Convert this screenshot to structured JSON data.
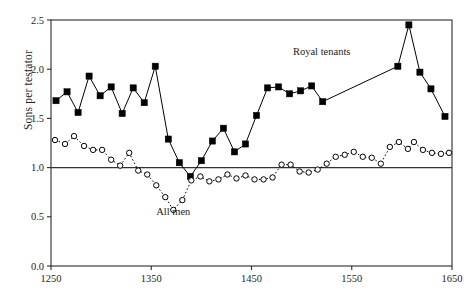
{
  "chart_data": {
    "type": "line",
    "title": "",
    "xlabel": "",
    "ylabel": "Sons per testator",
    "xlim": [
      1250,
      1650
    ],
    "ylim": [
      0.0,
      2.5
    ],
    "xticks": [
      1250,
      1350,
      1450,
      1550,
      1650
    ],
    "xtick_labels": [
      "1250",
      "1350",
      "1450",
      "1550",
      "1650"
    ],
    "yticks": [
      0.0,
      0.5,
      1.0,
      1.5,
      2.0,
      2.5
    ],
    "ytick_labels": [
      "0.0",
      "0.5",
      "1.0",
      "1.5",
      "2.0",
      "2.5"
    ],
    "grid": false,
    "legend_position": "inline-annotation",
    "reference_line": {
      "y": 1.0,
      "style": "solid",
      "color": "#333333"
    },
    "annotations": [
      {
        "text": "Royal tenants",
        "x": 1520,
        "y": 2.14
      },
      {
        "text": "All men",
        "x": 1372,
        "y": 0.52
      }
    ],
    "series": [
      {
        "name": "Royal tenants",
        "marker": "filled-square",
        "color": "#000000",
        "linestyle": "solid",
        "points": [
          {
            "x": 1255,
            "y": 1.68
          },
          {
            "x": 1266,
            "y": 1.77
          },
          {
            "x": 1277,
            "y": 1.56
          },
          {
            "x": 1288,
            "y": 1.93
          },
          {
            "x": 1299,
            "y": 1.73
          },
          {
            "x": 1310,
            "y": 1.82
          },
          {
            "x": 1321,
            "y": 1.55
          },
          {
            "x": 1332,
            "y": 1.81
          },
          {
            "x": 1343,
            "y": 1.66
          },
          {
            "x": 1354,
            "y": 2.03
          },
          {
            "x": 1367,
            "y": 1.29
          },
          {
            "x": 1378,
            "y": 1.05
          },
          {
            "x": 1389,
            "y": 0.91
          },
          {
            "x": 1400,
            "y": 1.07
          },
          {
            "x": 1411,
            "y": 1.27
          },
          {
            "x": 1422,
            "y": 1.4
          },
          {
            "x": 1433,
            "y": 1.16
          },
          {
            "x": 1444,
            "y": 1.24
          },
          {
            "x": 1455,
            "y": 1.53
          },
          {
            "x": 1466,
            "y": 1.81
          },
          {
            "x": 1477,
            "y": 1.82
          },
          {
            "x": 1488,
            "y": 1.75
          },
          {
            "x": 1499,
            "y": 1.78
          },
          {
            "x": 1510,
            "y": 1.83
          },
          {
            "x": 1521,
            "y": 1.67
          },
          {
            "x": 1596,
            "y": 2.03
          },
          {
            "x": 1607,
            "y": 2.45
          },
          {
            "x": 1618,
            "y": 1.97
          },
          {
            "x": 1629,
            "y": 1.8
          },
          {
            "x": 1643,
            "y": 1.52
          }
        ]
      },
      {
        "name": "All men",
        "marker": "open-circle",
        "color": "#000000",
        "linestyle": "dotted",
        "points": [
          {
            "x": 1254,
            "y": 1.28
          },
          {
            "x": 1264,
            "y": 1.24
          },
          {
            "x": 1273,
            "y": 1.32
          },
          {
            "x": 1283,
            "y": 1.22
          },
          {
            "x": 1292,
            "y": 1.18
          },
          {
            "x": 1301,
            "y": 1.18
          },
          {
            "x": 1310,
            "y": 1.08
          },
          {
            "x": 1319,
            "y": 1.02
          },
          {
            "x": 1328,
            "y": 1.15
          },
          {
            "x": 1337,
            "y": 0.97
          },
          {
            "x": 1346,
            "y": 0.93
          },
          {
            "x": 1355,
            "y": 0.82
          },
          {
            "x": 1364,
            "y": 0.7
          },
          {
            "x": 1372,
            "y": 0.57
          },
          {
            "x": 1381,
            "y": 0.67
          },
          {
            "x": 1390,
            "y": 0.87
          },
          {
            "x": 1399,
            "y": 0.91
          },
          {
            "x": 1408,
            "y": 0.86
          },
          {
            "x": 1417,
            "y": 0.88
          },
          {
            "x": 1426,
            "y": 0.93
          },
          {
            "x": 1435,
            "y": 0.89
          },
          {
            "x": 1444,
            "y": 0.92
          },
          {
            "x": 1453,
            "y": 0.88
          },
          {
            "x": 1462,
            "y": 0.88
          },
          {
            "x": 1471,
            "y": 0.9
          },
          {
            "x": 1480,
            "y": 1.03
          },
          {
            "x": 1489,
            "y": 1.03
          },
          {
            "x": 1498,
            "y": 0.96
          },
          {
            "x": 1507,
            "y": 0.95
          },
          {
            "x": 1516,
            "y": 0.98
          },
          {
            "x": 1525,
            "y": 1.04
          },
          {
            "x": 1534,
            "y": 1.11
          },
          {
            "x": 1543,
            "y": 1.13
          },
          {
            "x": 1552,
            "y": 1.16
          },
          {
            "x": 1561,
            "y": 1.11
          },
          {
            "x": 1570,
            "y": 1.1
          },
          {
            "x": 1579,
            "y": 1.04
          },
          {
            "x": 1588,
            "y": 1.21
          },
          {
            "x": 1597,
            "y": 1.26
          },
          {
            "x": 1606,
            "y": 1.19
          },
          {
            "x": 1612,
            "y": 1.26
          },
          {
            "x": 1621,
            "y": 1.18
          },
          {
            "x": 1630,
            "y": 1.15
          },
          {
            "x": 1639,
            "y": 1.14
          },
          {
            "x": 1647,
            "y": 1.15
          }
        ]
      }
    ]
  }
}
